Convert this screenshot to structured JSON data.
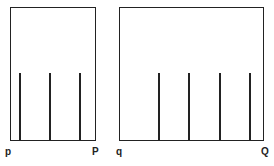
{
  "diagram": {
    "left_panel": {
      "start_label": "p",
      "end_label": "P",
      "line_count": 3
    },
    "right_panel": {
      "start_label": "q",
      "end_label": "Q",
      "line_count": 4
    },
    "colors": {
      "stroke": "#222222",
      "background": "#ffffff"
    }
  }
}
